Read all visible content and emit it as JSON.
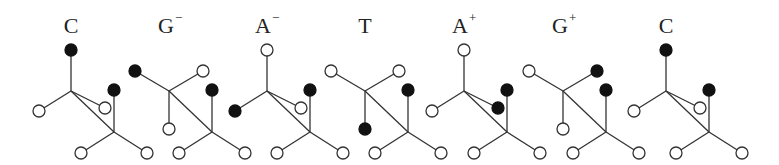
{
  "figure": {
    "width": 779,
    "height": 165,
    "node_radius": 6,
    "colors": {
      "filled": "#111111",
      "open": "#ffffff",
      "stroke": "#333333",
      "text": "#222222"
    },
    "units": [
      {
        "label": "C",
        "sup": "",
        "label_x": 71,
        "dx": 0,
        "top": "filled",
        "left": "open",
        "right": "open",
        "below": null,
        "upper_type": "vertical",
        "small_side": "open"
      },
      {
        "label": "G",
        "sup": "−",
        "label_x": 166,
        "dx": 98,
        "top": null,
        "left": "filled",
        "right": "open",
        "below": "open",
        "upper_type": "fork",
        "small_side": null
      },
      {
        "label": "A",
        "sup": "−",
        "label_x": 263,
        "dx": 196,
        "top": "open",
        "left": "filled",
        "right": "open",
        "below": null,
        "upper_type": "vertical",
        "small_side": "open"
      },
      {
        "label": "T",
        "sup": "",
        "label_x": 365,
        "dx": 294,
        "top": null,
        "left": "open",
        "right": "open",
        "below": "filled",
        "upper_type": "fork",
        "small_side": null
      },
      {
        "label": "A",
        "sup": "+",
        "label_x": 460,
        "dx": 393,
        "top": "open",
        "left": "open",
        "right": "filled",
        "below": null,
        "upper_type": "vertical",
        "small_side": "filled"
      },
      {
        "label": "G",
        "sup": "+",
        "label_x": 560,
        "dx": 492,
        "top": null,
        "left": "open",
        "right": "filled",
        "below": "open",
        "upper_type": "fork",
        "small_side": null
      },
      {
        "label": "C",
        "sup": "",
        "label_x": 666,
        "dx": 595,
        "top": "filled",
        "left": "open",
        "right": "open",
        "below": null,
        "upper_type": "vertical",
        "small_side": "open"
      }
    ],
    "lower_group": {
      "top": "filled",
      "bottom_left": "open",
      "bottom_right": "open"
    }
  }
}
